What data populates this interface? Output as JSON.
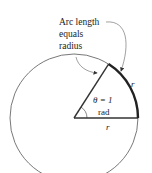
{
  "diagram": {
    "callout_lines": [
      "Arc length",
      "equals",
      "radius"
    ],
    "angle_label": "θ = 1",
    "angle_unit": "rad",
    "radius_label_arc": "r",
    "radius_label_base": "r",
    "angle_radians": 1,
    "colors": {
      "stroke": "#333333",
      "arc": "#222222",
      "text": "#222222"
    }
  }
}
